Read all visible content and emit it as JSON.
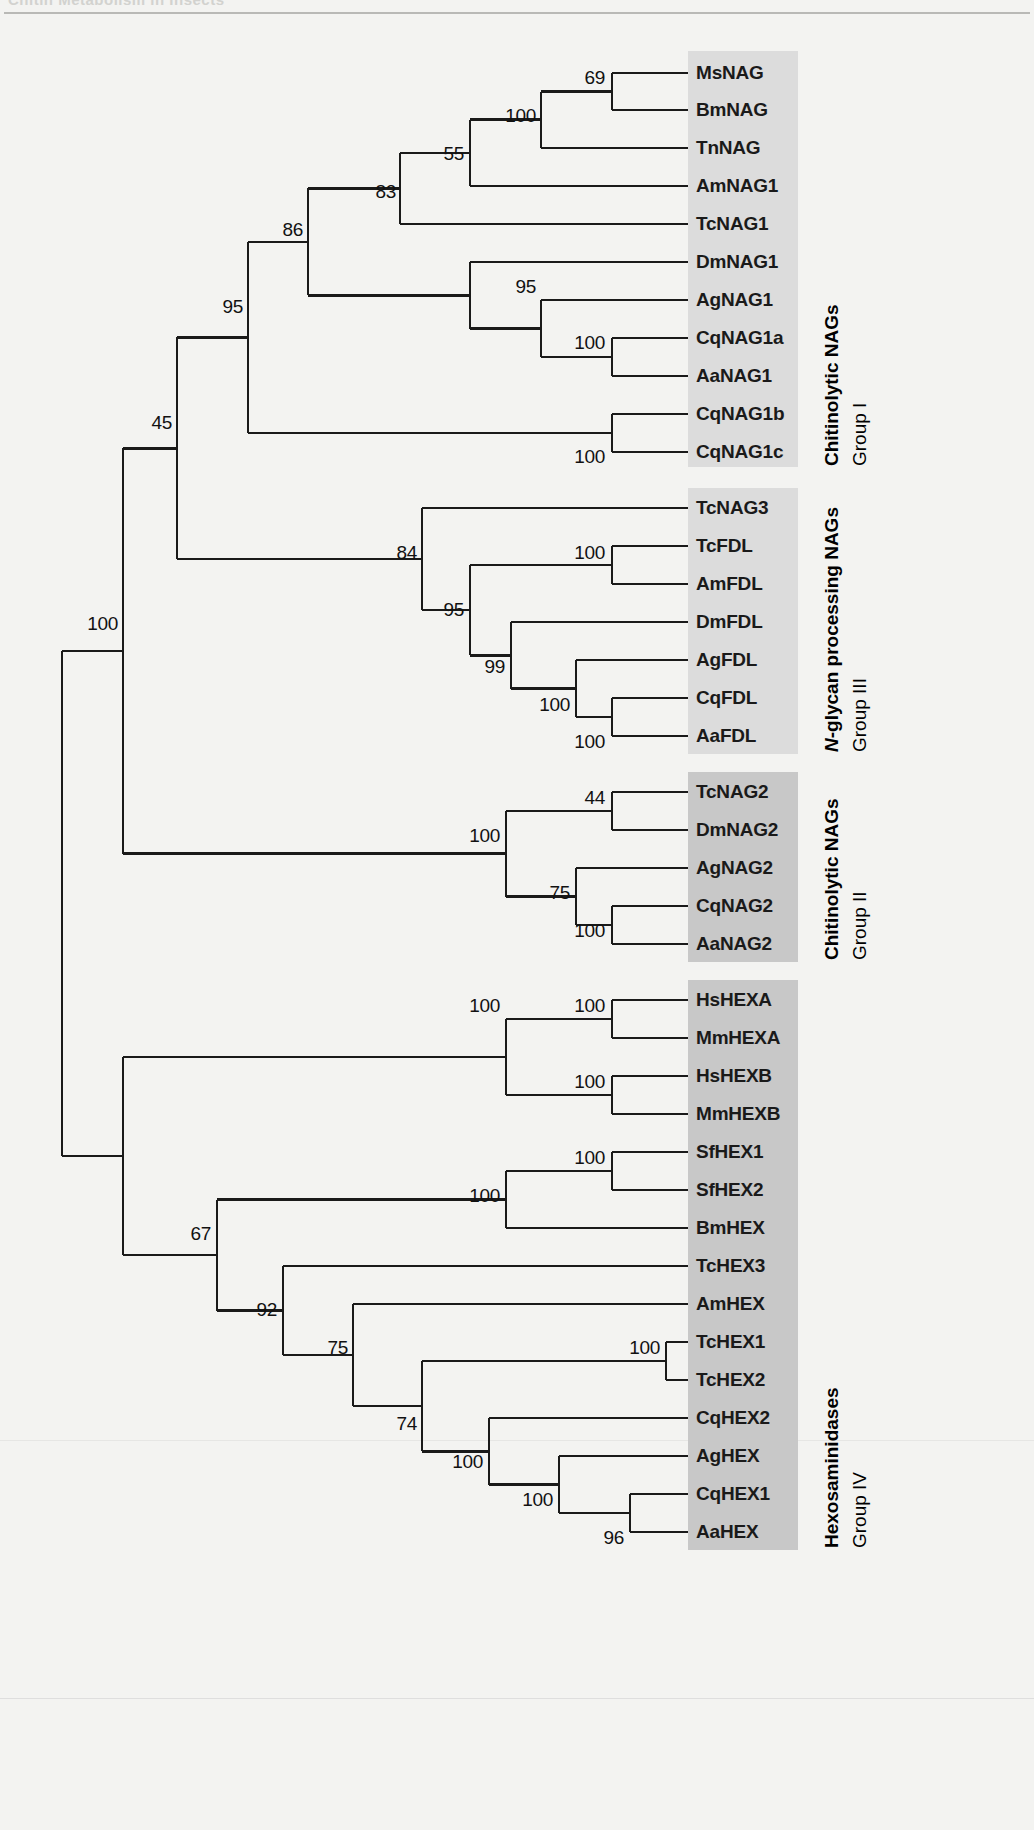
{
  "page": {
    "running_head": "Chitin Metabolism in Insects",
    "background_color": "#f3f3f1",
    "line_color": "#1a1a1a"
  },
  "chart_data": {
    "type": "tree",
    "node_label_type": "bootstrap support (%)",
    "taxa": [
      {
        "id": "MsNAG",
        "label": "MsNAG",
        "y": 73,
        "group": "I"
      },
      {
        "id": "BmNAG",
        "label": "BmNAG",
        "y": 110,
        "group": "I"
      },
      {
        "id": "TnNAG",
        "label": "TnNAG",
        "y": 148,
        "group": "I"
      },
      {
        "id": "AmNAG1",
        "label": "AmNAG1",
        "y": 186,
        "group": "I"
      },
      {
        "id": "TcNAG1",
        "label": "TcNAG1",
        "y": 224,
        "group": "I"
      },
      {
        "id": "DmNAG1",
        "label": "DmNAG1",
        "y": 262,
        "group": "I"
      },
      {
        "id": "AgNAG1",
        "label": "AgNAG1",
        "y": 300,
        "group": "I"
      },
      {
        "id": "CqNAG1a",
        "label": "CqNAG1a",
        "y": 338,
        "group": "I"
      },
      {
        "id": "AaNAG1",
        "label": "AaNAG1",
        "y": 376,
        "group": "I"
      },
      {
        "id": "CqNAG1b",
        "label": "CqNAG1b",
        "y": 414,
        "group": "I"
      },
      {
        "id": "CqNAG1c",
        "label": "CqNAG1c",
        "y": 452,
        "group": "I"
      },
      {
        "id": "TcNAG3",
        "label": "TcNAG3",
        "y": 508,
        "group": "III"
      },
      {
        "id": "TcFDL",
        "label": "TcFDL",
        "y": 546,
        "group": "III"
      },
      {
        "id": "AmFDL",
        "label": "AmFDL",
        "y": 584,
        "group": "III"
      },
      {
        "id": "DmFDL",
        "label": "DmFDL",
        "y": 622,
        "group": "III"
      },
      {
        "id": "AgFDL",
        "label": "AgFDL",
        "y": 660,
        "group": "III"
      },
      {
        "id": "CqFDL",
        "label": "CqFDL",
        "y": 698,
        "group": "III"
      },
      {
        "id": "AaFDL",
        "label": "AaFDL",
        "y": 736,
        "group": "III"
      },
      {
        "id": "TcNAG2",
        "label": "TcNAG2",
        "y": 792,
        "group": "II"
      },
      {
        "id": "DmNAG2",
        "label": "DmNAG2",
        "y": 830,
        "group": "II"
      },
      {
        "id": "AgNAG2",
        "label": "AgNAG2",
        "y": 868,
        "group": "II"
      },
      {
        "id": "CqNAG2",
        "label": "CqNAG2",
        "y": 906,
        "group": "II"
      },
      {
        "id": "AaNAG2",
        "label": "AaNAG2",
        "y": 944,
        "group": "II"
      },
      {
        "id": "HsHEXA",
        "label": "HsHEXA",
        "y": 1000,
        "group": "IV"
      },
      {
        "id": "MmHEXA",
        "label": "MmHEXA",
        "y": 1038,
        "group": "IV"
      },
      {
        "id": "HsHEXB",
        "label": "HsHEXB",
        "y": 1076,
        "group": "IV"
      },
      {
        "id": "MmHEXB",
        "label": "MmHEXB",
        "y": 1114,
        "group": "IV"
      },
      {
        "id": "SfHEX1",
        "label": "SfHEX1",
        "y": 1152,
        "group": "IV"
      },
      {
        "id": "SfHEX2",
        "label": "SfHEX2",
        "y": 1190,
        "group": "IV"
      },
      {
        "id": "BmHEX",
        "label": "BmHEX",
        "y": 1228,
        "group": "IV"
      },
      {
        "id": "TcHEX3",
        "label": "TcHEX3",
        "y": 1266,
        "group": "IV"
      },
      {
        "id": "AmHEX",
        "label": "AmHEX",
        "y": 1304,
        "group": "IV"
      },
      {
        "id": "TcHEX1",
        "label": "TcHEX1",
        "y": 1342,
        "group": "IV"
      },
      {
        "id": "TcHEX2",
        "label": "TcHEX2",
        "y": 1380,
        "group": "IV"
      },
      {
        "id": "CqHEX2",
        "label": "CqHEX2",
        "y": 1418,
        "group": "IV"
      },
      {
        "id": "AgHEX",
        "label": "AgHEX",
        "y": 1456,
        "group": "IV"
      },
      {
        "id": "CqHEX1",
        "label": "CqHEX1",
        "y": 1494,
        "group": "IV"
      },
      {
        "id": "AaHEX",
        "label": "AaHEX",
        "y": 1532,
        "group": "IV"
      }
    ],
    "bootstrap_values": [
      {
        "value": "69",
        "x": 605,
        "y": 78
      },
      {
        "value": "100",
        "x": 536,
        "y": 116
      },
      {
        "value": "55",
        "x": 464,
        "y": 154
      },
      {
        "value": "83",
        "x": 396,
        "y": 192
      },
      {
        "value": "86",
        "x": 303,
        "y": 230
      },
      {
        "value": "95",
        "x": 536,
        "y": 287
      },
      {
        "value": "100",
        "x": 605,
        "y": 343
      },
      {
        "value": "100",
        "x": 605,
        "y": 457
      },
      {
        "value": "95",
        "x": 243,
        "y": 307
      },
      {
        "value": "45",
        "x": 172,
        "y": 423
      },
      {
        "value": "84",
        "x": 417,
        "y": 553
      },
      {
        "value": "100",
        "x": 605,
        "y": 553
      },
      {
        "value": "95",
        "x": 464,
        "y": 610
      },
      {
        "value": "99",
        "x": 505,
        "y": 667
      },
      {
        "value": "100",
        "x": 570,
        "y": 705
      },
      {
        "value": "100",
        "x": 605,
        "y": 742
      },
      {
        "value": "44",
        "x": 605,
        "y": 798
      },
      {
        "value": "100",
        "x": 500,
        "y": 836
      },
      {
        "value": "75",
        "x": 570,
        "y": 893
      },
      {
        "value": "100",
        "x": 605,
        "y": 931
      },
      {
        "value": "100",
        "x": 500,
        "y": 1006
      },
      {
        "value": "100",
        "x": 605,
        "y": 1006
      },
      {
        "value": "100",
        "x": 605,
        "y": 1082
      },
      {
        "value": "100",
        "x": 605,
        "y": 1158
      },
      {
        "value": "100",
        "x": 500,
        "y": 1196
      },
      {
        "value": "67",
        "x": 211,
        "y": 1234
      },
      {
        "value": "92",
        "x": 277,
        "y": 1310
      },
      {
        "value": "75",
        "x": 348,
        "y": 1348
      },
      {
        "value": "100",
        "x": 660,
        "y": 1348
      },
      {
        "value": "74",
        "x": 417,
        "y": 1424
      },
      {
        "value": "100",
        "x": 483,
        "y": 1462
      },
      {
        "value": "100",
        "x": 553,
        "y": 1500
      },
      {
        "value": "96",
        "x": 624,
        "y": 1538
      },
      {
        "value": "100",
        "x": 118,
        "y": 624
      }
    ],
    "groups": [
      {
        "id": "I",
        "line1": "Chitinolytic NAGs",
        "line2": "Group I",
        "shade": "#dcdcdc",
        "box": {
          "x": 688,
          "y": 51,
          "w": 110,
          "h": 416
        },
        "label_x": 822,
        "label_y": 466
      },
      {
        "id": "III",
        "line1_html": "<i>N</i>-glycan processing NAGs",
        "line1_plain": "N-glycan processing NAGs",
        "line2": "Group III",
        "shade": "#dcdcdc",
        "box": {
          "x": 688,
          "y": 488,
          "w": 110,
          "h": 266
        },
        "label_x": 822,
        "label_y": 752
      },
      {
        "id": "II",
        "line1": "Chitinolytic NAGs",
        "line2": "Group II",
        "shade": "#c8c8c8",
        "box": {
          "x": 688,
          "y": 772,
          "w": 110,
          "h": 190
        },
        "label_x": 822,
        "label_y": 960
      },
      {
        "id": "IV",
        "line1": "Hexosaminidases",
        "line2": "Group IV",
        "shade": "#c8c8c8",
        "box": {
          "x": 688,
          "y": 980,
          "w": 110,
          "h": 570
        },
        "label_x": 822,
        "label_y": 1548
      }
    ]
  }
}
